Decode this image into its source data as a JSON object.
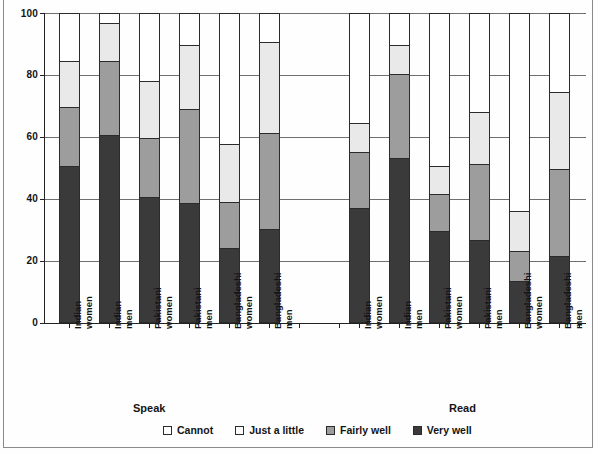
{
  "chart_data": {
    "type": "bar",
    "stacked": true,
    "title": "",
    "xlabel": "",
    "ylabel": "Percentage",
    "ylim": [
      0,
      100
    ],
    "yticks": [
      0,
      20,
      40,
      60,
      80,
      100
    ],
    "grid": true,
    "legend_position": "bottom",
    "groups": [
      "Speak",
      "Read"
    ],
    "categories": [
      "Indian women",
      "Indian men",
      "Pakistani women",
      "Pakistani men",
      "Bangladeshi women",
      "Bangladeshi men"
    ],
    "series": [
      {
        "name": "Very well",
        "color": "#3a3a3a",
        "values_speak": [
          51,
          61,
          41,
          39,
          24.5,
          30.5
        ],
        "values_read": [
          37.5,
          53.5,
          30,
          27,
          14,
          22
        ]
      },
      {
        "name": "Fairly well",
        "color": "#9d9d9d",
        "values_speak": [
          19,
          24,
          19,
          30.5,
          15,
          31
        ],
        "values_read": [
          18,
          27,
          12,
          24.5,
          9.5,
          28
        ]
      },
      {
        "name": "Just a little",
        "color": "#e9e9e9",
        "values_speak": [
          15,
          12,
          18.5,
          20.5,
          18.5,
          29.5
        ],
        "values_read": [
          9.5,
          9.5,
          9,
          17,
          13,
          25
        ]
      },
      {
        "name": "Cannot",
        "color": "#ffffff",
        "values_speak": [
          15,
          3,
          21.5,
          10,
          42,
          9
        ],
        "values_read": [
          35,
          10,
          49,
          31.5,
          63.5,
          25
        ]
      }
    ],
    "cumulative_tops": {
      "speak": [
        {
          "very": 51,
          "fairly": 70,
          "just": 85,
          "cannot": 100
        },
        {
          "very": 61,
          "fairly": 85,
          "just": 97,
          "cannot": 100
        },
        {
          "very": 41,
          "fairly": 60,
          "just": 78.5,
          "cannot": 100
        },
        {
          "very": 39,
          "fairly": 69.5,
          "just": 90,
          "cannot": 100
        },
        {
          "very": 24.5,
          "fairly": 39.5,
          "just": 58,
          "cannot": 100
        },
        {
          "very": 30.5,
          "fairly": 61.5,
          "just": 91,
          "cannot": 100
        }
      ],
      "read": [
        {
          "very": 37.5,
          "fairly": 55.5,
          "just": 65,
          "cannot": 100
        },
        {
          "very": 53.5,
          "fairly": 80.5,
          "just": 90,
          "cannot": 100
        },
        {
          "very": 30,
          "fairly": 42,
          "just": 51,
          "cannot": 100
        },
        {
          "very": 27,
          "fairly": 51.5,
          "just": 68.5,
          "cannot": 100
        },
        {
          "very": 14,
          "fairly": 23.5,
          "just": 36.5,
          "cannot": 100
        },
        {
          "very": 22,
          "fairly": 50,
          "just": 75,
          "cannot": 100
        }
      ]
    }
  },
  "axis": {
    "y_title": "Percentage",
    "y_tick_labels": [
      "100",
      "80",
      "60",
      "40",
      "20",
      "0"
    ]
  },
  "cat_labels": [
    {
      "l1": "Indian",
      "l2": "women"
    },
    {
      "l1": "Indian",
      "l2": "men"
    },
    {
      "l1": "Pakistani",
      "l2": "women"
    },
    {
      "l1": "Pakistani",
      "l2": "men"
    },
    {
      "l1": "Bangladeshi",
      "l2": "women"
    },
    {
      "l1": "Bangladeshi",
      "l2": "men"
    },
    {
      "l1": "Indian",
      "l2": "women"
    },
    {
      "l1": "Indian",
      "l2": "men"
    },
    {
      "l1": "Pakistani",
      "l2": "women"
    },
    {
      "l1": "Pakistani",
      "l2": "men"
    },
    {
      "l1": "Bangladeshi",
      "l2": "women"
    },
    {
      "l1": "Bangladeshi",
      "l2": "men"
    }
  ],
  "group_labels": {
    "speak": "Speak",
    "read": "Read"
  },
  "legend": {
    "items": [
      {
        "label": "Cannot",
        "swatch": "sw-cannot"
      },
      {
        "label": "Just a little",
        "swatch": "sw-just"
      },
      {
        "label": "Fairly well",
        "swatch": "sw-fairly"
      },
      {
        "label": "Very well",
        "swatch": "sw-very"
      }
    ]
  }
}
